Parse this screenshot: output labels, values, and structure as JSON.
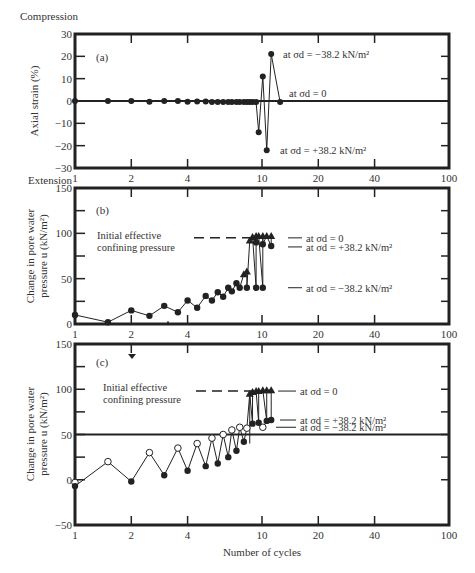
{
  "figure": {
    "xlabel": "Number of cycles",
    "x_scale": "log",
    "xlim": [
      1,
      100
    ],
    "x_ticks": [
      1,
      2,
      4,
      10,
      20,
      40,
      100
    ],
    "x_tick_labels": [
      "1",
      "2",
      "4",
      "10",
      "20",
      "40",
      "100"
    ]
  },
  "chart_data": [
    {
      "type": "line",
      "panel": "(a)",
      "ylabel": "Axial strain (%)",
      "top_label": "Compression",
      "bottom_label": "Extension",
      "ylim": [
        -30,
        30
      ],
      "y_ticks": [
        -30,
        -20,
        -10,
        0,
        10,
        20,
        30
      ],
      "y_tick_labels": [
        "−30",
        "−20",
        "−10",
        "0",
        "10",
        "20",
        "30"
      ],
      "reference_lines": [
        {
          "y": 0,
          "style": "solid"
        }
      ],
      "annotations": [
        {
          "text": "at σd = −38.2 kN/m²",
          "x": 11.5,
          "y": 21
        },
        {
          "text": "at σd = 0",
          "x": 13,
          "y": 2
        },
        {
          "text": "at σd = +38.2 kN/m²",
          "x": 11.5,
          "y": -22
        }
      ],
      "series": [
        {
          "name": "axial strain",
          "marker": "filled-circle",
          "x": [
            1,
            1.5,
            2,
            2.5,
            3,
            3.55,
            4,
            4.5,
            5,
            5.4,
            5.8,
            6.2,
            6.6,
            6.9,
            7.3,
            7.6,
            8,
            8.3,
            8.6,
            8.9,
            9.3,
            9.6,
            10.1,
            10.6,
            11.2,
            12.5
          ],
          "y": [
            0,
            0,
            0,
            -0.3,
            0,
            0,
            -0.3,
            -0.2,
            -0.2,
            -0.4,
            -0.5,
            -0.5,
            -0.4,
            -0.5,
            -0.5,
            -0.5,
            -0.5,
            -0.5,
            -0.5,
            -0.5,
            -0.5,
            -14,
            11,
            -22,
            21,
            -0.5
          ]
        }
      ]
    },
    {
      "type": "line",
      "panel": "(b)",
      "ylabel": "Change in pore water pressure u (kN/m²)",
      "ylim": [
        0,
        150
      ],
      "y_ticks": [
        0,
        50,
        100,
        150
      ],
      "y_tick_labels": [
        "0",
        "50",
        "100",
        "150"
      ],
      "reference_lines": [
        {
          "y": 95,
          "style": "dashed",
          "label": "Initial effective confining pressure"
        }
      ],
      "annotations": [
        {
          "text": "at σd = 0",
          "y": 95
        },
        {
          "text": "at σd = +38.2 kN/m²",
          "y": 85
        },
        {
          "text": "at σd = −38.2 kN/m²",
          "y": 40
        }
      ],
      "series": [
        {
          "name": "pore pressure (circles)",
          "marker": "filled-circle",
          "x": [
            1,
            1.5,
            2,
            2.5,
            3,
            3.55,
            4,
            4.5,
            5,
            5.4,
            5.8,
            6.2,
            6.6,
            6.9,
            7.3,
            7.6
          ],
          "y": [
            10,
            2,
            15,
            9,
            20,
            13,
            26,
            18,
            31,
            26,
            35,
            30,
            40,
            36,
            45,
            40
          ]
        },
        {
          "name": "pore pressure at σd = 0 (triangles)",
          "marker": "filled-triangle",
          "x": [
            8.0,
            8.3,
            8.6,
            8.9,
            9.3,
            9.6,
            10.1,
            10.6,
            11.2
          ],
          "y": [
            55,
            58,
            92,
            96,
            97,
            97,
            97,
            97,
            97
          ]
        },
        {
          "name": "pore pressure at σd = +38.2 (circles)",
          "marker": "filled-circle",
          "x": [
            9.3,
            10.1,
            11.2
          ],
          "y": [
            90,
            88,
            86
          ]
        },
        {
          "name": "pore pressure at σd = −38.2 (circles)",
          "marker": "filled-circle",
          "x": [
            8.3,
            9.3,
            10.1
          ],
          "y": [
            40,
            40,
            40
          ]
        }
      ]
    },
    {
      "type": "line",
      "panel": "(c)",
      "ylabel": "Change in pore water pressure u (kN/m²)",
      "ylim": [
        -50,
        150
      ],
      "y_ticks": [
        -50,
        0,
        50,
        100,
        150
      ],
      "y_tick_labels": [
        "−50",
        "0",
        "50",
        "100",
        "150"
      ],
      "reference_lines": [
        {
          "y": 98,
          "style": "dashed",
          "label": "Initial effective confining pressure"
        },
        {
          "y": 50,
          "style": "solid"
        }
      ],
      "annotations": [
        {
          "text": "at σd = 0",
          "y": 98
        },
        {
          "text": "at σd = +38.2 kN/m²",
          "y": 65
        },
        {
          "text": "at σd = −38.2 kN/m²",
          "y": 57
        }
      ],
      "series": [
        {
          "name": "open circles (peaks)",
          "marker": "open-circle",
          "x": [
            1,
            1.5,
            2.5,
            3.55,
            4.5,
            5.4,
            6.2,
            6.9,
            7.6,
            8.3
          ],
          "y": [
            -3,
            20,
            30,
            35,
            40,
            46,
            50,
            55,
            58,
            57
          ]
        },
        {
          "name": "filled circles (troughs)",
          "marker": "filled-circle",
          "x": [
            1,
            2,
            3,
            4,
            5,
            5.8,
            6.6,
            7.3,
            8.0
          ],
          "y": [
            -7,
            -2,
            5,
            10,
            15,
            18,
            25,
            32,
            42
          ]
        },
        {
          "name": "triangles at σd = 0",
          "marker": "filled-triangle",
          "x": [
            8.6,
            8.9,
            9.3,
            9.6,
            10.1,
            10.6,
            11.2
          ],
          "y": [
            95,
            97,
            98,
            98,
            99,
            99,
            99
          ]
        },
        {
          "name": "filled circles at σd = +38.2",
          "marker": "filled-circle",
          "x": [
            8.9,
            9.6,
            10.6,
            11.2
          ],
          "y": [
            62,
            63,
            65,
            66
          ]
        }
      ]
    }
  ]
}
